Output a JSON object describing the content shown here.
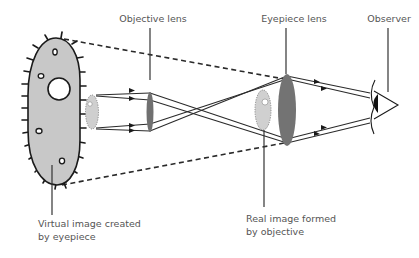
{
  "diagram": {
    "colors": {
      "background": "#ffffff",
      "line": "#2a2a2a",
      "cell_fill": "#c8c8c8",
      "lens_fill": "#707070",
      "real_image_fill": "#d0d0d0",
      "label_text": "#555555",
      "leader_line": "#333333"
    },
    "labels": {
      "objective_lens": "Objective lens",
      "eyepiece_lens": "Eyepiece lens",
      "observer": "Observer",
      "virtual_image_line1": "Virtual image created",
      "virtual_image_line2": "by eyepiece",
      "real_image_line1": "Real image formed",
      "real_image_line2": "by objective"
    },
    "components": [
      {
        "id": "virtual-image",
        "icon": "cell-organism-icon",
        "description": "large gray cell with cilia"
      },
      {
        "id": "specimen",
        "icon": "small-cell-icon",
        "description": "small specimen before objective"
      },
      {
        "id": "objective-lens",
        "icon": "lens-icon"
      },
      {
        "id": "real-image",
        "icon": "small-cell-icon"
      },
      {
        "id": "eyepiece-lens",
        "icon": "lens-icon"
      },
      {
        "id": "observer",
        "icon": "eye-icon"
      }
    ]
  }
}
